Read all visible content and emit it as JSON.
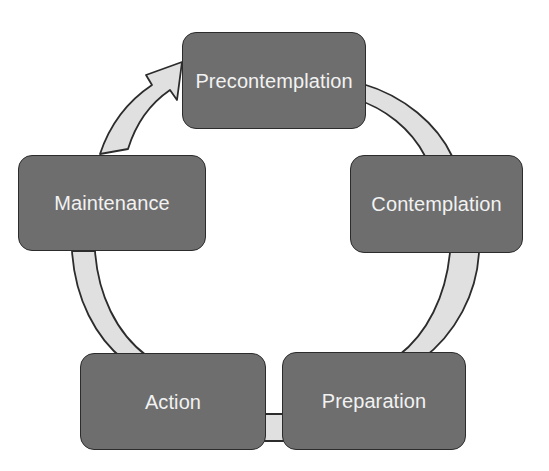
{
  "diagram": {
    "type": "cycle",
    "direction": "clockwise",
    "colors": {
      "box_fill": "#6e6e6e",
      "box_border": "#2c2c2c",
      "box_text": "#f2f2f2",
      "ribbon_fill": "#e0e0e0",
      "ribbon_border": "#2c2c2c",
      "background": "#ffffff"
    },
    "stages": [
      {
        "id": "precontemplation",
        "label": "Precontemplation",
        "position": "top"
      },
      {
        "id": "contemplation",
        "label": "Contemplation",
        "position": "right"
      },
      {
        "id": "preparation",
        "label": "Preparation",
        "position": "bottom-right"
      },
      {
        "id": "action",
        "label": "Action",
        "position": "bottom-left"
      },
      {
        "id": "maintenance",
        "label": "Maintenance",
        "position": "left"
      }
    ],
    "connectors": [
      {
        "id": "precontemplation-to-contemplation",
        "from": "precontemplation",
        "to": "contemplation",
        "style": "ribbon",
        "arrowhead": false
      },
      {
        "id": "contemplation-to-preparation",
        "from": "contemplation",
        "to": "preparation",
        "style": "ribbon",
        "arrowhead": false
      },
      {
        "id": "preparation-to-action",
        "from": "preparation",
        "to": "action",
        "style": "ribbon",
        "arrowhead": false
      },
      {
        "id": "action-to-maintenance",
        "from": "action",
        "to": "maintenance",
        "style": "ribbon",
        "arrowhead": false
      },
      {
        "id": "maintenance-to-precontemplation",
        "from": "maintenance",
        "to": "precontemplation",
        "style": "ribbon",
        "arrowhead": true
      }
    ]
  }
}
